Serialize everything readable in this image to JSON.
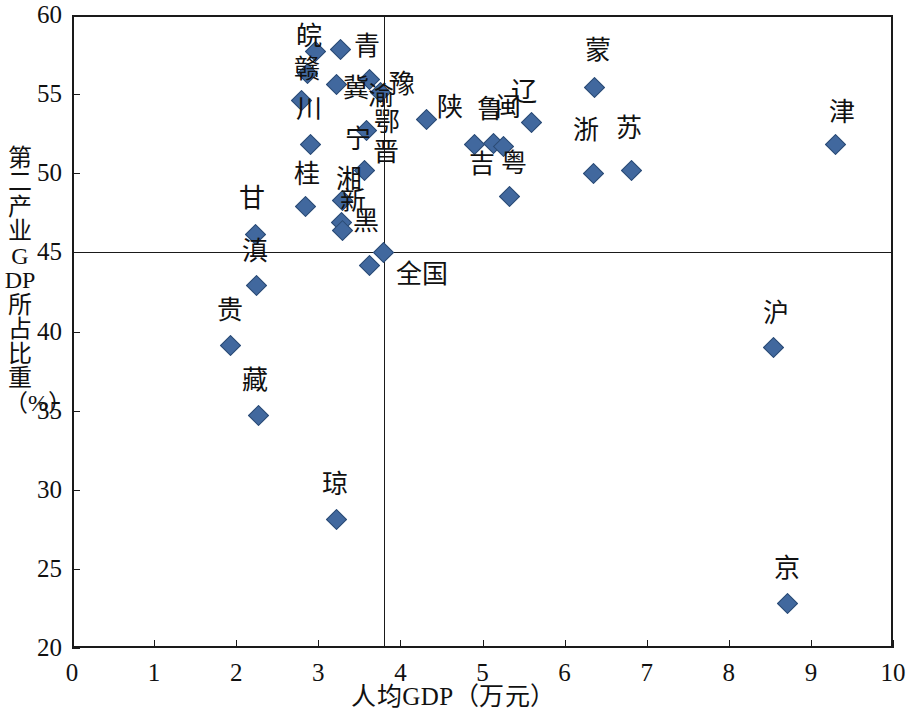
{
  "chart_data": {
    "type": "scatter",
    "title": "",
    "xlabel": "人均GDP（万元）",
    "ylabel": "第二产业GDP所占比重（%）",
    "xlim": [
      0,
      10
    ],
    "ylim": [
      20,
      60
    ],
    "xticks": [
      "0",
      "1",
      "2",
      "3",
      "4",
      "5",
      "6",
      "7",
      "8",
      "9",
      "10"
    ],
    "yticks": [
      "20",
      "25",
      "30",
      "35",
      "40",
      "45",
      "50",
      "55",
      "60"
    ],
    "grid": false,
    "legend": null,
    "marker_color": "#41689e",
    "marker_edge_color": "#2b4a73",
    "marker_shape": "diamond",
    "reference_lines": {
      "x": 3.8,
      "y": 45.0,
      "note": "全国 (national average) crosshair"
    },
    "annotations": [
      {
        "text": "全国",
        "x": 3.95,
        "y": 43.6
      }
    ],
    "points": [
      {
        "label": "皖",
        "x": 2.97,
        "y": 57.7,
        "lx": 2.73,
        "ly": 58.6,
        "vertical": false
      },
      {
        "label": "赣",
        "x": 2.87,
        "y": 56.3,
        "lx": 2.7,
        "ly": 56.5,
        "vertical": false
      },
      {
        "label": "川",
        "x": 2.8,
        "y": 54.6,
        "lx": 2.73,
        "ly": 54.0,
        "vertical": false
      },
      {
        "label": "青",
        "x": 3.27,
        "y": 57.8,
        "lx": 3.43,
        "ly": 58.0,
        "vertical": false
      },
      {
        "label": "冀",
        "x": 3.22,
        "y": 55.6,
        "lx": 3.3,
        "ly": 55.3,
        "vertical": false
      },
      {
        "label": "渝",
        "x": 3.62,
        "y": 55.9,
        "lx": 3.6,
        "ly": 54.8,
        "vertical": false
      },
      {
        "label": "豫",
        "x": 3.76,
        "y": 55.1,
        "lx": 3.86,
        "ly": 55.6,
        "vertical": false
      },
      {
        "label": "陕",
        "x": 4.32,
        "y": 53.4,
        "lx": 4.45,
        "ly": 54.1,
        "vertical": false
      },
      {
        "label": "辽",
        "x": 5.6,
        "y": 53.2,
        "lx": 5.35,
        "ly": 55.1,
        "vertical": false
      },
      {
        "label": "蒙",
        "x": 6.36,
        "y": 55.4,
        "lx": 6.25,
        "ly": 57.7,
        "vertical": false
      },
      {
        "label": "津",
        "x": 9.3,
        "y": 51.8,
        "lx": 9.22,
        "ly": 53.8,
        "vertical": false
      },
      {
        "label": "鄂",
        "x": 3.59,
        "y": 52.7,
        "lx": 3.63,
        "ly": 53.3,
        "vertical": true
      },
      {
        "label": "宁",
        "x": 2.9,
        "y": 51.8,
        "lx": 3.33,
        "ly": 52.1,
        "vertical": false
      },
      {
        "label": "晋",
        "x": 3.56,
        "y": 50.2,
        "lx": 3.62,
        "ly": 51.4,
        "vertical": true
      },
      {
        "label": "鲁",
        "x": 5.14,
        "y": 51.9,
        "lx": 4.93,
        "ly": 54.0,
        "vertical": false
      },
      {
        "label": "闽",
        "x": 5.25,
        "y": 51.7,
        "lx": 5.15,
        "ly": 54.1,
        "vertical": false
      },
      {
        "label": "浙",
        "x": 6.35,
        "y": 50.0,
        "lx": 6.1,
        "ly": 52.7,
        "vertical": false
      },
      {
        "label": "苏",
        "x": 6.82,
        "y": 50.2,
        "lx": 6.63,
        "ly": 52.8,
        "vertical": false
      },
      {
        "label": "粤",
        "x": 5.33,
        "y": 48.5,
        "lx": 5.22,
        "ly": 50.6,
        "vertical": false
      },
      {
        "label": "吉",
        "x": 4.9,
        "y": 51.8,
        "lx": 4.83,
        "ly": 50.5,
        "vertical": false
      },
      {
        "label": "桂",
        "x": 2.84,
        "y": 47.9,
        "lx": 2.7,
        "ly": 49.9,
        "vertical": false
      },
      {
        "label": "湘",
        "x": 3.3,
        "y": 48.3,
        "lx": 3.22,
        "ly": 49.6,
        "vertical": false
      },
      {
        "label": "新",
        "x": 3.28,
        "y": 46.9,
        "lx": 3.27,
        "ly": 48.2,
        "vertical": false
      },
      {
        "label": "黑",
        "x": 3.29,
        "y": 46.4,
        "lx": 3.42,
        "ly": 46.9,
        "vertical": false
      },
      {
        "label": "甘",
        "x": 2.24,
        "y": 46.1,
        "lx": 2.03,
        "ly": 48.4,
        "vertical": false
      },
      {
        "label": "滇",
        "x": 2.25,
        "y": 42.9,
        "lx": 2.07,
        "ly": 45.0,
        "vertical": false
      },
      {
        "label": "贵",
        "x": 1.93,
        "y": 39.1,
        "lx": 1.77,
        "ly": 41.3,
        "vertical": false
      },
      {
        "label": "藏",
        "x": 2.27,
        "y": 34.7,
        "lx": 2.07,
        "ly": 36.9,
        "vertical": false
      },
      {
        "label": "琼",
        "x": 3.22,
        "y": 28.1,
        "lx": 3.05,
        "ly": 30.3,
        "vertical": false
      },
      {
        "label": "沪",
        "x": 8.55,
        "y": 39.0,
        "lx": 8.42,
        "ly": 41.1,
        "vertical": false
      },
      {
        "label": "京",
        "x": 8.72,
        "y": 22.8,
        "lx": 8.55,
        "ly": 25.0,
        "vertical": false
      },
      {
        "label": "",
        "x": 3.62,
        "y": 44.2,
        "lx": null,
        "ly": null,
        "vertical": false
      },
      {
        "label": "",
        "x": 3.8,
        "y": 45.0,
        "lx": null,
        "ly": null,
        "vertical": false
      }
    ]
  }
}
